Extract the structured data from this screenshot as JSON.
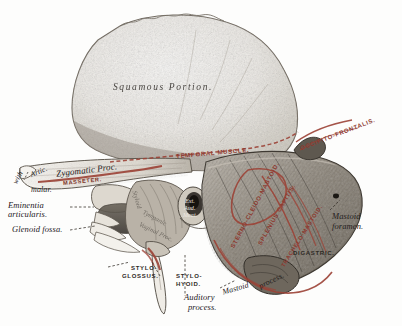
{
  "figure": {
    "background_color": "#fdfdfc",
    "ink_color": "#24201c",
    "muscle_color": "#8d3a30"
  },
  "bone_labels": [
    {
      "key": "squamous_portion",
      "text": "Squamous Portion."
    },
    {
      "key": "artic_with_malar",
      "text": "Artic."
    },
    {
      "key": "artic_with_malar_2",
      "text": "with"
    },
    {
      "key": "artic_with_malar_3",
      "text": "malar."
    },
    {
      "key": "zygomatic_process",
      "text": "Zygomatic Proc."
    },
    {
      "key": "eminentia_articularis_1",
      "text": "Eminentia"
    },
    {
      "key": "eminentia_articularis_2",
      "text": "articularis."
    },
    {
      "key": "glenoid_fossa",
      "text": "Glenoid fossa."
    },
    {
      "key": "ext_aud_meat_1",
      "text": "Ext."
    },
    {
      "key": "ext_aud_meat_2",
      "text": "Aud."
    },
    {
      "key": "ext_aud_meat_3",
      "text": "Meat."
    },
    {
      "key": "vaginal_process",
      "text": "Vaginal Proc."
    },
    {
      "key": "tympanic_plate",
      "text": "Tympanic"
    },
    {
      "key": "styloid_process",
      "text": "Styloid"
    },
    {
      "key": "mastoid_foramen_1",
      "text": "Mastoid"
    },
    {
      "key": "mastoid_foramen_2",
      "text": "foramen."
    },
    {
      "key": "mastoid_process",
      "text": "Mastoid"
    },
    {
      "key": "mastoid_process_2",
      "text": "process."
    },
    {
      "key": "auditory_process_1",
      "text": "Auditory"
    },
    {
      "key": "auditory_process_2",
      "text": "process."
    }
  ],
  "muscle_labels": [
    {
      "key": "temporal_muscle",
      "text": "TEMPORAL  MUSCLE."
    },
    {
      "key": "occipito_frontalis",
      "text": "OCCIPITO-FRONTALIS."
    },
    {
      "key": "masseter",
      "text": "MASSETER."
    },
    {
      "key": "sterno_cleido_mastoid",
      "text": "STERNO-CLEIDO-MASTOID."
    },
    {
      "key": "splenius_capitis",
      "text": "SPLENIUS CAPITIS."
    },
    {
      "key": "trachelo_mastoid",
      "text": "TRACHELO-MASTOID."
    },
    {
      "key": "digastric",
      "text": "DIGASTRIC."
    },
    {
      "key": "stylo_glossus_1",
      "text": "STYLO-"
    },
    {
      "key": "stylo_glossus_2",
      "text": "GLOSSUS."
    },
    {
      "key": "stylo_hyoid_1",
      "text": "STYLO-"
    },
    {
      "key": "stylo_hyoid_2",
      "text": "HYOID."
    }
  ]
}
